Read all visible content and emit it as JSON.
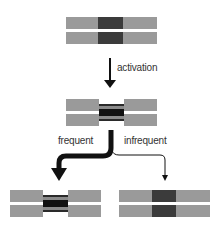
{
  "diagram": {
    "type": "state-transition",
    "colors": {
      "segment_gray": "#9a9a9a",
      "core_dark": "#3b3b3b",
      "stripe_black": "#1a1a1a",
      "arrow": "#111111",
      "background": "#ffffff"
    },
    "nodes": [
      {
        "id": "initial",
        "state": "open dark core"
      },
      {
        "id": "activated",
        "state": "constricted striped core"
      },
      {
        "id": "frequent-result",
        "state": "constricted striped core"
      },
      {
        "id": "infrequent-result",
        "state": "open dark core"
      }
    ],
    "edges": [
      {
        "from": "initial",
        "to": "activated",
        "label": "activation",
        "weight": "normal"
      },
      {
        "from": "activated",
        "to": "frequent-result",
        "label": "frequent",
        "weight": "thick"
      },
      {
        "from": "activated",
        "to": "infrequent-result",
        "label": "infrequent",
        "weight": "thin"
      }
    ]
  },
  "labels": {
    "activation": "activation",
    "frequent": "frequent",
    "infrequent": "infrequent"
  }
}
